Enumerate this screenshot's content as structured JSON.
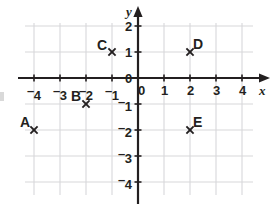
{
  "chart_data": {
    "type": "scatter",
    "title": "",
    "xlabel": "x",
    "ylabel": "y",
    "xlim": [
      -4.6,
      4.6
    ],
    "ylim": [
      -4.6,
      2.6
    ],
    "grid": true,
    "legend": "none",
    "x_ticks": [
      {
        "value": -4,
        "label": "4",
        "negative": true
      },
      {
        "value": -3,
        "label": "3",
        "negative": true
      },
      {
        "value": -2,
        "label": "2",
        "negative": true
      },
      {
        "value": -1,
        "label": "1",
        "negative": true
      },
      {
        "value": 0,
        "label": "0",
        "negative": false
      },
      {
        "value": 1,
        "label": "1",
        "negative": false
      },
      {
        "value": 2,
        "label": "2",
        "negative": false
      },
      {
        "value": 3,
        "label": "3",
        "negative": false
      },
      {
        "value": 4,
        "label": "4",
        "negative": false
      }
    ],
    "y_ticks": [
      {
        "value": 2,
        "label": "2",
        "negative": false
      },
      {
        "value": 1,
        "label": "1",
        "negative": false
      },
      {
        "value": 0,
        "label": "0",
        "negative": false
      },
      {
        "value": -1,
        "label": "1",
        "negative": true
      },
      {
        "value": -2,
        "label": "2",
        "negative": true
      },
      {
        "value": -3,
        "label": "3",
        "negative": true
      },
      {
        "value": -4,
        "label": "4",
        "negative": true
      }
    ],
    "points": [
      {
        "label": "A",
        "x": -4,
        "y": -2,
        "label_dx": -14,
        "label_dy": -15
      },
      {
        "label": "B",
        "x": -2,
        "y": -1,
        "label_dx": -15,
        "label_dy": -15
      },
      {
        "label": "C",
        "x": -1,
        "y": 1,
        "label_dx": -15,
        "label_dy": -14
      },
      {
        "label": "D",
        "x": 2,
        "y": 1,
        "label_dx": 3,
        "label_dy": -15
      },
      {
        "label": "E",
        "x": 2,
        "y": -2,
        "label_dx": 3,
        "label_dy": -15
      }
    ],
    "colors": {
      "axis": "#231f20",
      "grid": "#d7d7da",
      "marker": "#231f20",
      "text": "#231f20",
      "background": "#ffffff"
    }
  },
  "geometry": {
    "origin_x": 138,
    "origin_y": 78,
    "unit": 26.0,
    "grid_left": 25,
    "grid_right": 253,
    "grid_top": 23,
    "grid_bottom": 195,
    "x_axis_end": 262,
    "y_axis_end": 14
  }
}
